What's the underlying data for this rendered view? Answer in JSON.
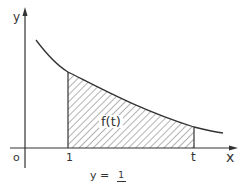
{
  "diagram": {
    "type": "area-under-curve",
    "axes": {
      "y_label": "y",
      "x_label": "x",
      "origin_label": "o"
    },
    "ticks": {
      "lower_bound_label": "1",
      "upper_bound_label": "t"
    },
    "region_label": "f(t)",
    "formula": {
      "lhs": "y",
      "equals": "=",
      "numerator": "1",
      "denominator_visible": false
    },
    "colors": {
      "stroke": "#333333",
      "hatch": "#555555",
      "background": "#ffffff"
    }
  }
}
